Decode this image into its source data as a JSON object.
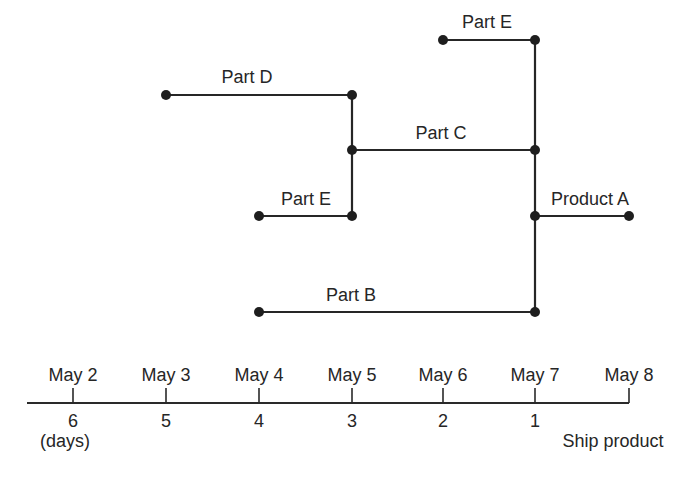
{
  "diagram": {
    "type": "assembly-time-chart",
    "edges": [
      {
        "id": "part-e-top",
        "label": "Part E",
        "x1": 443,
        "x2": 535,
        "y": 40,
        "label_x": 487,
        "label_y": 28
      },
      {
        "id": "part-d",
        "label": "Part D",
        "x1": 166,
        "x2": 352,
        "y": 95,
        "label_x": 247,
        "label_y": 83
      },
      {
        "id": "part-c",
        "label": "Part C",
        "x1": 352,
        "x2": 535,
        "y": 150,
        "label_x": 441,
        "label_y": 139
      },
      {
        "id": "part-e-bottom",
        "label": "Part E",
        "x1": 259,
        "x2": 352,
        "y": 216,
        "label_x": 306,
        "label_y": 205
      },
      {
        "id": "product-a",
        "label": "Product A",
        "x1": 535,
        "x2": 629,
        "y": 216,
        "label_x": 590,
        "label_y": 205
      },
      {
        "id": "part-b",
        "label": "Part B",
        "x1": 259,
        "x2": 535,
        "y": 312,
        "label_x": 351,
        "label_y": 301
      }
    ],
    "connectors": [
      {
        "x": 352,
        "y1": 95,
        "y2": 216
      },
      {
        "x": 535,
        "y1": 40,
        "y2": 312
      }
    ],
    "nodes": [
      {
        "x": 443,
        "y": 40
      },
      {
        "x": 535,
        "y": 40
      },
      {
        "x": 166,
        "y": 95
      },
      {
        "x": 352,
        "y": 95
      },
      {
        "x": 352,
        "y": 150
      },
      {
        "x": 535,
        "y": 150
      },
      {
        "x": 259,
        "y": 216
      },
      {
        "x": 352,
        "y": 216
      },
      {
        "x": 535,
        "y": 216
      },
      {
        "x": 629,
        "y": 216
      },
      {
        "x": 259,
        "y": 312
      },
      {
        "x": 535,
        "y": 312
      }
    ]
  },
  "timeline": {
    "axis": {
      "x1": 27,
      "x2": 629,
      "y": 403
    },
    "ticks": [
      {
        "x": 73,
        "date": "May 2",
        "days": "6"
      },
      {
        "x": 166,
        "date": "May 3",
        "days": "5"
      },
      {
        "x": 259,
        "date": "May 4",
        "days": "4"
      },
      {
        "x": 352,
        "date": "May 5",
        "days": "3"
      },
      {
        "x": 443,
        "date": "May 6",
        "days": "2"
      },
      {
        "x": 535,
        "date": "May 7",
        "days": "1"
      },
      {
        "x": 629,
        "date": "May 8",
        "days": ""
      }
    ],
    "days_unit_label": "(days)",
    "ship_label": "Ship product"
  },
  "colors": {
    "line": "#262626",
    "node": "#1e1e1e",
    "text": "#262626",
    "background": "#ffffff"
  }
}
